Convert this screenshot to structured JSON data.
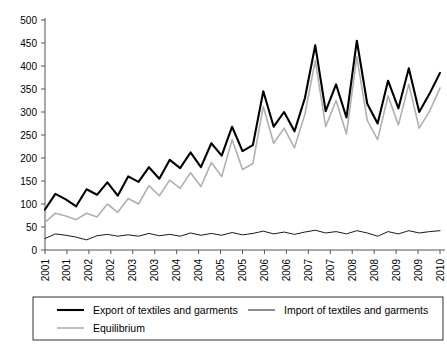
{
  "chart_data": {
    "type": "line",
    "title": "",
    "xlabel": "",
    "ylabel": "",
    "ylim": [
      0,
      500
    ],
    "ytick_step": 50,
    "yticks": [
      "0",
      "50",
      "100",
      "150",
      "200",
      "250",
      "300",
      "350",
      "400",
      "450",
      "500"
    ],
    "grid": false,
    "legend_position": "bottom",
    "xtick_labels": [
      "2001",
      "2001",
      "2002",
      "2002",
      "2003",
      "2003",
      "2004",
      "2004",
      "2005",
      "2005",
      "2006",
      "2006",
      "2007",
      "2007",
      "2008",
      "2008",
      "2009",
      "2009",
      "2010"
    ],
    "x": [
      "2001Q1",
      "2001Q2",
      "2001Q3",
      "2001Q4",
      "2002Q1",
      "2002Q2",
      "2002Q3",
      "2002Q4",
      "2003Q1",
      "2003Q2",
      "2003Q3",
      "2003Q4",
      "2004Q1",
      "2004Q2",
      "2004Q3",
      "2004Q4",
      "2005Q1",
      "2005Q2",
      "2005Q3",
      "2005Q4",
      "2006Q1",
      "2006Q2",
      "2006Q3",
      "2006Q4",
      "2007Q1",
      "2007Q2",
      "2007Q3",
      "2007Q4",
      "2008Q1",
      "2008Q2",
      "2008Q3",
      "2008Q4",
      "2009Q1",
      "2009Q2",
      "2009Q3",
      "2009Q4",
      "2010Q1",
      "2010Q2",
      "2010Q3"
    ],
    "series": [
      {
        "name": "Export of textiles and garments",
        "color": "#000000",
        "width": 2.1,
        "values": [
          88,
          122,
          110,
          95,
          132,
          120,
          147,
          118,
          160,
          148,
          180,
          155,
          196,
          178,
          212,
          180,
          232,
          205,
          268,
          215,
          228,
          345,
          268,
          300,
          258,
          330,
          445,
          302,
          360,
          288,
          455,
          318,
          275,
          368,
          308,
          395,
          300,
          340,
          385
        ]
      },
      {
        "name": "Import of textiles and garments",
        "color": "#000000",
        "width": 0.9,
        "values": [
          25,
          35,
          32,
          28,
          22,
          31,
          34,
          30,
          33,
          30,
          36,
          31,
          34,
          30,
          37,
          32,
          36,
          32,
          38,
          33,
          36,
          41,
          35,
          39,
          34,
          39,
          43,
          37,
          40,
          35,
          42,
          37,
          30,
          40,
          35,
          42,
          37,
          40,
          42
        ]
      },
      {
        "name": "Equilibrium",
        "color": "#b0b0b0",
        "width": 1.6,
        "values": [
          60,
          80,
          74,
          66,
          80,
          72,
          100,
          82,
          112,
          100,
          140,
          118,
          152,
          134,
          168,
          138,
          190,
          160,
          240,
          175,
          188,
          312,
          232,
          265,
          222,
          295,
          412,
          268,
          325,
          252,
          420,
          282,
          240,
          335,
          272,
          360,
          265,
          302,
          352
        ]
      }
    ]
  },
  "legend": {
    "items": [
      {
        "label": "Export of textiles and garments",
        "color": "#000000",
        "width": 2.1
      },
      {
        "label": "Import of textiles and garments",
        "color": "#000000",
        "width": 0.9
      },
      {
        "label": "Equilibrium",
        "color": "#b0b0b0",
        "width": 1.6
      }
    ]
  }
}
